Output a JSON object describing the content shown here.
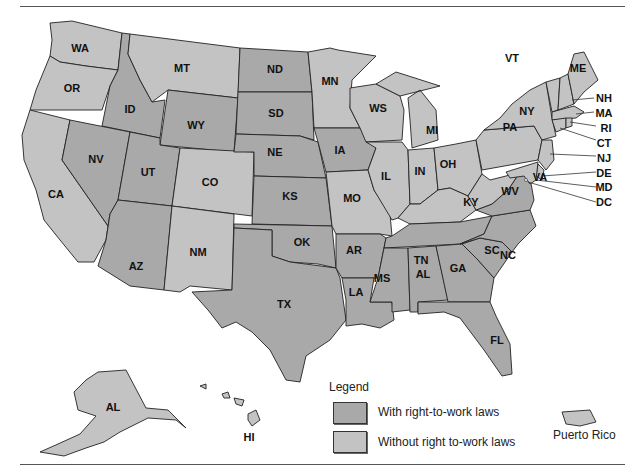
{
  "title": "",
  "colors": {
    "with_rtw": "#a9a9a9",
    "without_rtw": "#c3c3c3",
    "border": "#222222",
    "background": "#ffffff"
  },
  "legend": {
    "title": "Legend",
    "items": [
      {
        "label": "With right-to-work laws",
        "color": "#a9a9a9"
      },
      {
        "label": "Without right to-work laws",
        "color": "#c3c3c3"
      }
    ]
  },
  "territories": {
    "puerto_rico": "Puerto Rico"
  },
  "states": {
    "WA": {
      "label": "WA",
      "rtw": false
    },
    "OR": {
      "label": "OR",
      "rtw": false
    },
    "CA": {
      "label": "CA",
      "rtw": false
    },
    "ID": {
      "label": "ID",
      "rtw": true
    },
    "NV": {
      "label": "NV",
      "rtw": true
    },
    "MT": {
      "label": "MT",
      "rtw": false
    },
    "WY": {
      "label": "WY",
      "rtw": true
    },
    "UT": {
      "label": "UT",
      "rtw": true
    },
    "AZ": {
      "label": "AZ",
      "rtw": true
    },
    "CO": {
      "label": "CO",
      "rtw": false
    },
    "NM": {
      "label": "NM",
      "rtw": false
    },
    "ND": {
      "label": "ND",
      "rtw": true
    },
    "SD": {
      "label": "SD",
      "rtw": true
    },
    "NE": {
      "label": "NE",
      "rtw": true
    },
    "KS": {
      "label": "KS",
      "rtw": true
    },
    "OK": {
      "label": "OK",
      "rtw": true
    },
    "TX": {
      "label": "TX",
      "rtw": true
    },
    "MN": {
      "label": "MN",
      "rtw": false
    },
    "IA": {
      "label": "IA",
      "rtw": true
    },
    "MO": {
      "label": "MO",
      "rtw": false
    },
    "AR": {
      "label": "AR",
      "rtw": true
    },
    "LA": {
      "label": "LA",
      "rtw": true
    },
    "WS": {
      "label": "WS",
      "rtw": false
    },
    "IL": {
      "label": "IL",
      "rtw": false
    },
    "MI": {
      "label": "MI",
      "rtw": false
    },
    "IN": {
      "label": "IN",
      "rtw": false
    },
    "OH": {
      "label": "OH",
      "rtw": false
    },
    "KY": {
      "label": "KY",
      "rtw": false
    },
    "TN": {
      "label": "TN",
      "rtw": true
    },
    "MS": {
      "label": "MS",
      "rtw": true
    },
    "AL": {
      "label": "AL",
      "rtw": true
    },
    "GA": {
      "label": "GA",
      "rtw": true
    },
    "FL": {
      "label": "FL",
      "rtw": true
    },
    "SC": {
      "label": "SC",
      "rtw": true
    },
    "NC": {
      "label": "NC",
      "rtw": true
    },
    "VA": {
      "label": "VA",
      "rtw": true
    },
    "WV": {
      "label": "WV",
      "rtw": false
    },
    "PA": {
      "label": "PA",
      "rtw": false
    },
    "NY": {
      "label": "NY",
      "rtw": false
    },
    "VT": {
      "label": "VT",
      "rtw": false
    },
    "ME": {
      "label": "ME",
      "rtw": false
    },
    "NH": {
      "label": "NH",
      "rtw": false
    },
    "MA": {
      "label": "MA",
      "rtw": false
    },
    "RI": {
      "label": "RI",
      "rtw": false
    },
    "CT": {
      "label": "CT",
      "rtw": false
    },
    "NJ": {
      "label": "NJ",
      "rtw": false
    },
    "DE": {
      "label": "DE",
      "rtw": false
    },
    "MD": {
      "label": "MD",
      "rtw": false
    },
    "DC": {
      "label": "DC",
      "rtw": false
    },
    "AK": {
      "label": "AL",
      "rtw": false
    },
    "HI": {
      "label": "HI",
      "rtw": false
    }
  }
}
